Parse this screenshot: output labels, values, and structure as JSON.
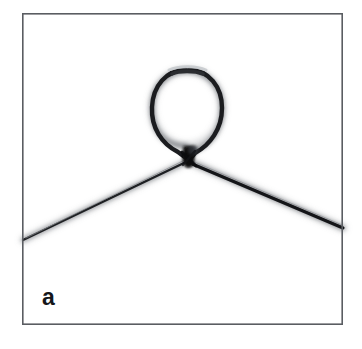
{
  "figure": {
    "panel_label": "a",
    "background_color": "#ffffff",
    "frame": {
      "border_color": "#5a5d62",
      "border_width_px": 1.6,
      "left": 22,
      "top": 13,
      "right": 343,
      "bottom": 325,
      "width": 321,
      "height": 312,
      "fill_color": "#ffffff"
    },
    "filament": {
      "stroke_color": "#1b1c1f",
      "halo_color": "#b9bcc0",
      "loop": {
        "center_x": 187,
        "center_y": 108,
        "radius_x": 35,
        "radius_y": 38,
        "stroke_width_px": 4.2,
        "top_y": 72,
        "left_x": 152,
        "right_x": 222,
        "bottom_y": 146
      },
      "knot": {
        "x": 188,
        "y": 161,
        "blob_color": "#101113",
        "blob_width_px": 13,
        "blob_height_px": 20
      },
      "left_strand": {
        "start_x": 23,
        "start_y": 240,
        "end_x": 188,
        "end_y": 161,
        "stroke_width_px": 2.4
      },
      "right_strand": {
        "start_x": 188,
        "start_y": 161,
        "end_x": 343,
        "end_y": 228,
        "stroke_width_px": 3.2
      }
    }
  }
}
